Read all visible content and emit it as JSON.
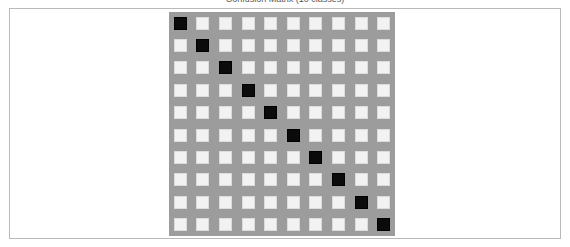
{
  "figure": {
    "caption": "Confusion Matrix (10 classes)",
    "panel_background_color": "#9c9c9c",
    "frame_border_color": "#b9b9b9",
    "page_background_color": "#ffffff"
  },
  "chart_data": {
    "type": "heatmap",
    "title": "Confusion Matrix (10 classes)",
    "xlabel": "",
    "ylabel": "",
    "grid": true,
    "legend_position": "none",
    "rows": 10,
    "cols": 10,
    "row_labels": [
      "0",
      "1",
      "2",
      "3",
      "4",
      "5",
      "6",
      "7",
      "8",
      "9"
    ],
    "col_labels": [
      "0",
      "1",
      "2",
      "3",
      "4",
      "5",
      "6",
      "7",
      "8",
      "9"
    ],
    "value_colors": {
      "0": "#f2f2f2",
      "1": "#0b0b0b"
    },
    "zlim": [
      0,
      1
    ],
    "values": [
      [
        1,
        0,
        0,
        0,
        0,
        0,
        0,
        0,
        0,
        0
      ],
      [
        0,
        1,
        0,
        0,
        0,
        0,
        0,
        0,
        0,
        0
      ],
      [
        0,
        0,
        1,
        0,
        0,
        0,
        0,
        0,
        0,
        0
      ],
      [
        0,
        0,
        0,
        1,
        0,
        0,
        0,
        0,
        0,
        0
      ],
      [
        0,
        0,
        0,
        0,
        1,
        0,
        0,
        0,
        0,
        0
      ],
      [
        0,
        0,
        0,
        0,
        0,
        1,
        0,
        0,
        0,
        0
      ],
      [
        0,
        0,
        0,
        0,
        0,
        0,
        1,
        0,
        0,
        0
      ],
      [
        0,
        0,
        0,
        0,
        0,
        0,
        0,
        1,
        0,
        0
      ],
      [
        0,
        0,
        0,
        0,
        0,
        0,
        0,
        0,
        1,
        0
      ],
      [
        0,
        0,
        0,
        0,
        0,
        0,
        0,
        0,
        0,
        1
      ]
    ]
  }
}
